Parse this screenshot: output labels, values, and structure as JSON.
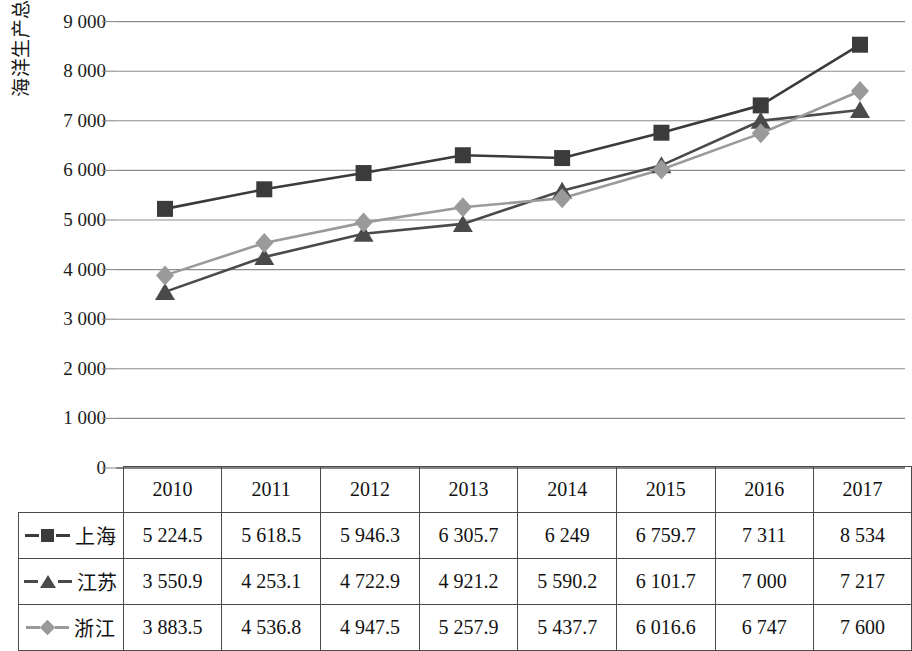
{
  "chart_data": {
    "type": "line",
    "title": "",
    "xlabel": "",
    "ylabel": "海洋生产总值/亿元",
    "ylim": [
      0,
      9000
    ],
    "ytick_step": 1000,
    "grid": true,
    "legend_position": "table-left-column",
    "categories": [
      "2010",
      "2011",
      "2012",
      "2013",
      "2014",
      "2015",
      "2016",
      "2017"
    ],
    "series": [
      {
        "name": "上海",
        "marker": "square",
        "color": "#3b3b3b",
        "values": [
          5224.5,
          5618.5,
          5946.3,
          6305.7,
          6249,
          6759.7,
          7311,
          8534
        ],
        "display_values": [
          "5 224.5",
          "5 618.5",
          "5 946.3",
          "6 305.7",
          "6 249",
          "6 759.7",
          "7 311",
          "8 534"
        ]
      },
      {
        "name": "江苏",
        "marker": "triangle",
        "color": "#4a4a4a",
        "values": [
          3550.9,
          4253.1,
          4722.9,
          4921.2,
          5590.2,
          6101.7,
          7000,
          7217
        ],
        "display_values": [
          "3 550.9",
          "4 253.1",
          "4 722.9",
          "4 921.2",
          "5 590.2",
          "6 101.7",
          "7 000",
          "7 217"
        ]
      },
      {
        "name": "浙江",
        "marker": "diamond",
        "color": "#9a9a9a",
        "values": [
          3883.5,
          4536.8,
          4947.5,
          5257.9,
          5437.7,
          6016.6,
          6747,
          7600
        ],
        "display_values": [
          "3 883.5",
          "4 536.8",
          "4 947.5",
          "5 257.9",
          "5 437.7",
          "6 016.6",
          "6 747",
          "7 600"
        ]
      }
    ],
    "ytick_labels": [
      "9 000",
      "8 000",
      "7 000",
      "6 000",
      "5 000",
      "4 000",
      "3 000",
      "2 000",
      "1 000",
      "0"
    ],
    "ytick_values": [
      9000,
      8000,
      7000,
      6000,
      5000,
      4000,
      3000,
      2000,
      1000,
      0
    ]
  },
  "table": {
    "corner_label": "",
    "column_headers": [
      "2010",
      "2011",
      "2012",
      "2013",
      "2014",
      "2015",
      "2016",
      "2017"
    ],
    "rows": [
      {
        "label": "上海",
        "marker": "square-marker",
        "cells": [
          "5 224.5",
          "5 618.5",
          "5 946.3",
          "6 305.7",
          "6 249",
          "6 759.7",
          "7 311",
          "8 534"
        ]
      },
      {
        "label": "江苏",
        "marker": "triangle-marker",
        "cells": [
          "3 550.9",
          "4 253.1",
          "4 722.9",
          "4 921.2",
          "5 590.2",
          "6 101.7",
          "7 000",
          "7 217"
        ]
      },
      {
        "label": "浙江",
        "marker": "diamond-marker",
        "cells": [
          "3 883.5",
          "4 536.8",
          "4 947.5",
          "5 257.9",
          "5 437.7",
          "6 016.6",
          "6 747",
          "7 600"
        ]
      }
    ]
  },
  "colors": {
    "shanghai": "#3b3b3b",
    "jiangsu": "#4a4a4a",
    "zhejiang": "#9a9a9a",
    "grid": "#8d8d8d",
    "axis": "#5a5a5a",
    "text": "#121212"
  }
}
